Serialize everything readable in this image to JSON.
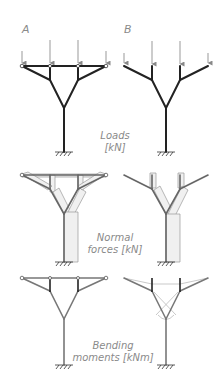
{
  "columns": [
    {
      "id": "A",
      "label": "A"
    },
    {
      "id": "B",
      "label": "B"
    }
  ],
  "rows": [
    {
      "id": "loads",
      "line1": "Loads",
      "line2": "[kN]"
    },
    {
      "id": "normal",
      "line1": "Normal",
      "line2": "forces [kN]"
    },
    {
      "id": "bending",
      "line1": "Bending",
      "line2": "moments [kNm]"
    }
  ],
  "colors": {
    "member": "#222222",
    "member_grey": "#777777",
    "diagram_outline": "#999999",
    "diagram_fill": "#e8e8e8",
    "label": "#8a8a8a",
    "arrow": "#888888"
  }
}
